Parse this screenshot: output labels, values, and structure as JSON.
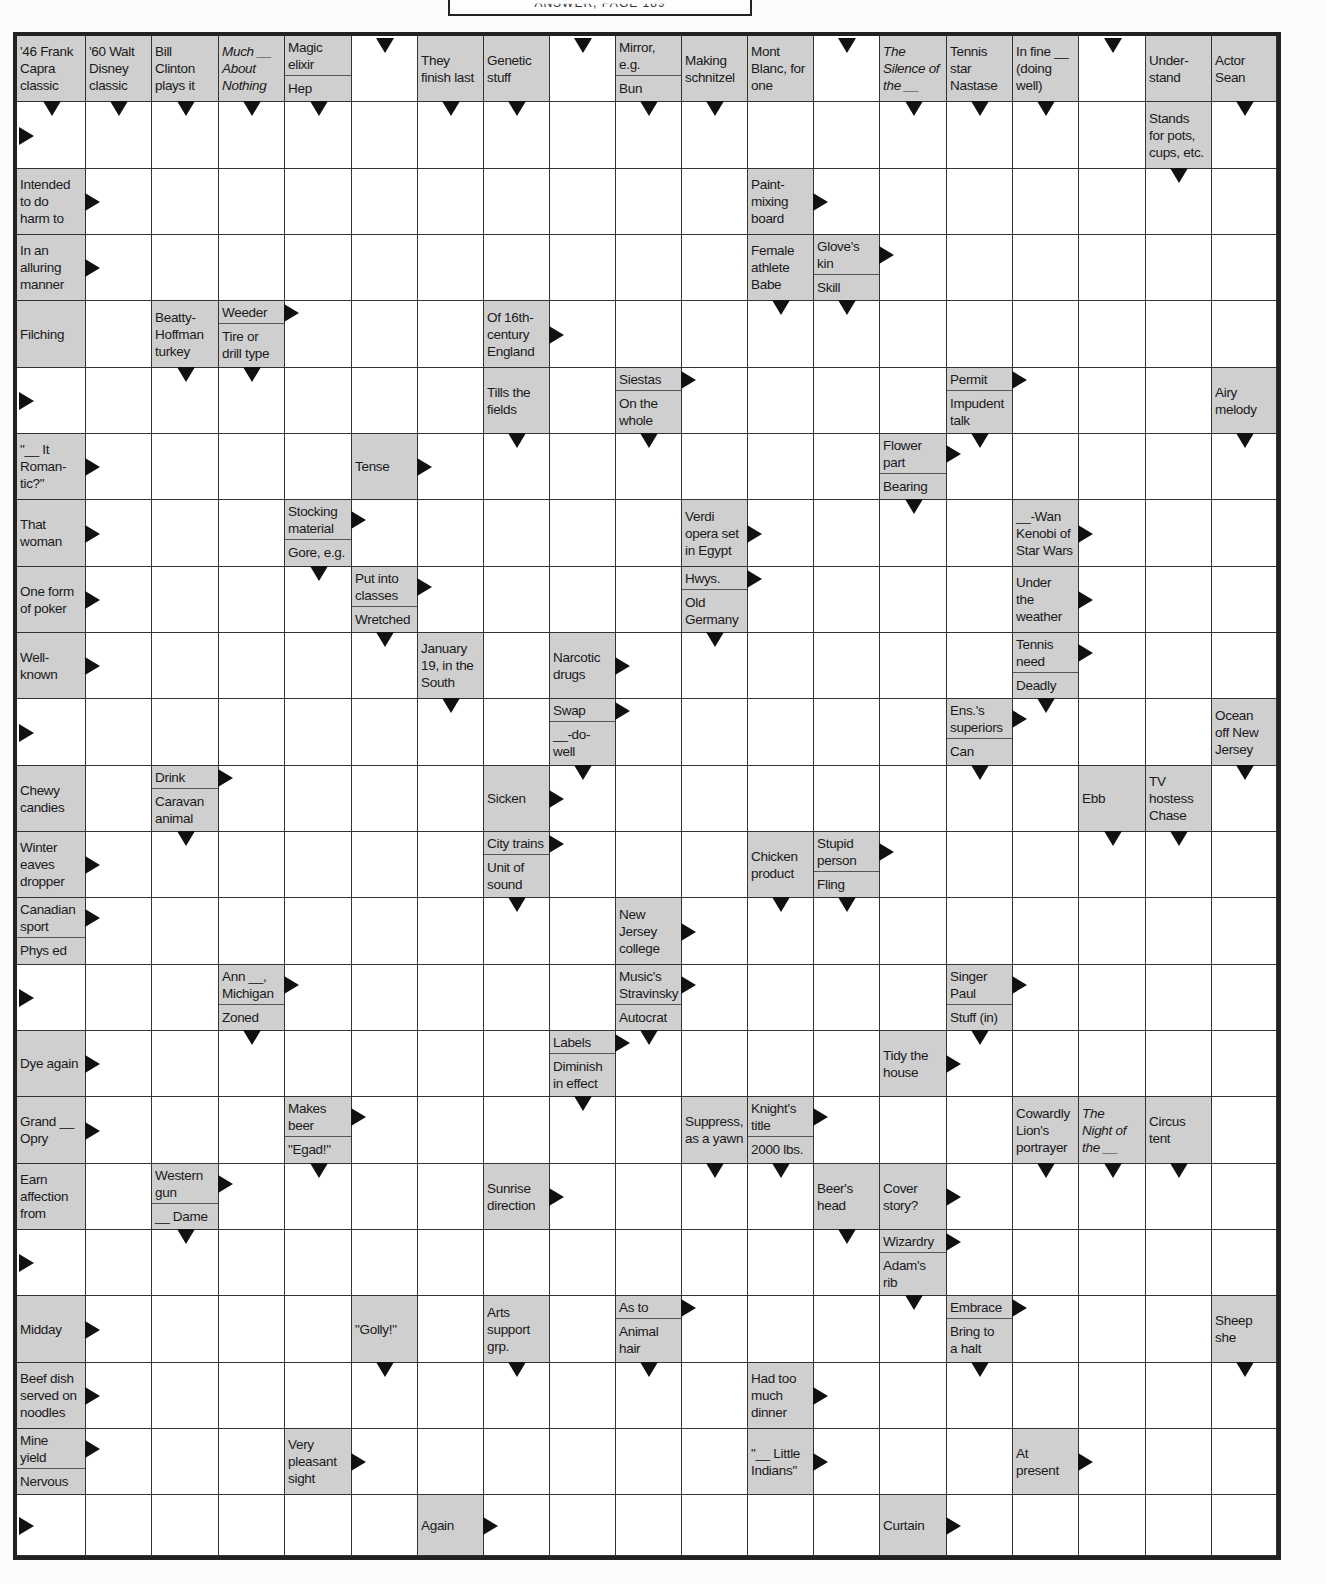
{
  "header": {
    "text": "ANSWER, PAGE 189"
  },
  "grid": {
    "cols": 19,
    "rows": 23,
    "col_x": [
      0,
      69,
      135,
      202,
      268,
      335,
      401,
      467,
      533,
      599,
      665,
      731,
      797,
      863,
      930,
      996,
      1062,
      1129,
      1195,
      1260
    ],
    "row_y": [
      0,
      66,
      133,
      199,
      265,
      332,
      398,
      464,
      531,
      597,
      663,
      730,
      796,
      862,
      929,
      995,
      1061,
      1128,
      1194,
      1260,
      1327,
      1393,
      1459,
      1520
    ]
  },
  "clues": [
    {
      "r": 0,
      "c": 0,
      "parts": [
        {
          "text": "'46 Frank\nCapra\nclassic",
          "dir": "down"
        }
      ]
    },
    {
      "r": 0,
      "c": 1,
      "parts": [
        {
          "text": "'60 Walt\nDisney\nclassic",
          "dir": "down"
        }
      ]
    },
    {
      "r": 0,
      "c": 2,
      "parts": [
        {
          "text": "Bill\nClinton\nplays it",
          "dir": "down"
        }
      ]
    },
    {
      "r": 0,
      "c": 3,
      "parts": [
        {
          "text": "Much __\nAbout\nNothing",
          "dir": "down",
          "italic": true
        }
      ]
    },
    {
      "r": 0,
      "c": 4,
      "parts": [
        {
          "text": "Magic\nelixir",
          "dir": "none"
        },
        {
          "text": "Hep",
          "dir": "down"
        }
      ]
    },
    {
      "r": 0,
      "c": 6,
      "parts": [
        {
          "text": "They\nfinish last",
          "dir": "down"
        }
      ]
    },
    {
      "r": 0,
      "c": 7,
      "parts": [
        {
          "text": "Genetic\nstuff",
          "dir": "down"
        }
      ]
    },
    {
      "r": 0,
      "c": 9,
      "parts": [
        {
          "text": "Mirror,\ne.g.",
          "dir": "none"
        },
        {
          "text": "Bun",
          "dir": "down"
        }
      ]
    },
    {
      "r": 0,
      "c": 10,
      "parts": [
        {
          "text": "Making\nschnitzel",
          "dir": "down"
        }
      ]
    },
    {
      "r": 0,
      "c": 11,
      "parts": [
        {
          "text": "Mont\nBlanc, for\none",
          "dir": "none"
        }
      ]
    },
    {
      "r": 0,
      "c": 13,
      "parts": [
        {
          "text": "The\nSilence of\nthe __",
          "dir": "down",
          "italic": true
        }
      ]
    },
    {
      "r": 0,
      "c": 14,
      "parts": [
        {
          "text": "Tennis\nstar\nNastase",
          "dir": "down"
        }
      ]
    },
    {
      "r": 0,
      "c": 15,
      "parts": [
        {
          "text": "In fine __\n(doing\nwell)",
          "dir": "down"
        }
      ]
    },
    {
      "r": 0,
      "c": 17,
      "parts": [
        {
          "text": "Under-\nstand",
          "dir": "none"
        }
      ]
    },
    {
      "r": 0,
      "c": 18,
      "parts": [
        {
          "text": "Actor\nSean",
          "dir": "down"
        }
      ]
    },
    {
      "r": 1,
      "c": 17,
      "parts": [
        {
          "text": "Stands\nfor pots,\ncups, etc.",
          "dir": "down"
        }
      ]
    },
    {
      "r": 2,
      "c": 0,
      "parts": [
        {
          "text": "Intended\nto do\nharm to",
          "dir": "right"
        }
      ]
    },
    {
      "r": 2,
      "c": 11,
      "parts": [
        {
          "text": "Paint-\nmixing\nboard",
          "dir": "right"
        }
      ]
    },
    {
      "r": 3,
      "c": 0,
      "parts": [
        {
          "text": "In an\nalluring\nmanner",
          "dir": "right"
        }
      ]
    },
    {
      "r": 3,
      "c": 11,
      "parts": [
        {
          "text": "Female\nathlete\nBabe",
          "dir": "down"
        }
      ]
    },
    {
      "r": 3,
      "c": 12,
      "parts": [
        {
          "text": "Glove's\nkin",
          "dir": "right"
        },
        {
          "text": "Skill",
          "dir": "down"
        }
      ]
    },
    {
      "r": 4,
      "c": 0,
      "parts": [
        {
          "text": "Filching",
          "dir": "none"
        }
      ]
    },
    {
      "r": 4,
      "c": 2,
      "parts": [
        {
          "text": "Beatty-\nHoffman\nturkey",
          "dir": "down"
        }
      ]
    },
    {
      "r": 4,
      "c": 3,
      "parts": [
        {
          "text": "Weeder",
          "dir": "right"
        },
        {
          "text": "Tire or\ndrill type",
          "dir": "down"
        }
      ]
    },
    {
      "r": 4,
      "c": 7,
      "parts": [
        {
          "text": "Of 16th-\ncentury\nEngland",
          "dir": "right"
        }
      ]
    },
    {
      "r": 5,
      "c": 7,
      "parts": [
        {
          "text": "Tills the\nfields",
          "dir": "down"
        }
      ]
    },
    {
      "r": 5,
      "c": 9,
      "parts": [
        {
          "text": "Siestas",
          "dir": "right"
        },
        {
          "text": "On the\nwhole",
          "dir": "down"
        }
      ]
    },
    {
      "r": 5,
      "c": 14,
      "parts": [
        {
          "text": "Permit",
          "dir": "right"
        },
        {
          "text": "Impudent\ntalk",
          "dir": "down"
        }
      ]
    },
    {
      "r": 5,
      "c": 18,
      "parts": [
        {
          "text": "Airy\nmelody",
          "dir": "down"
        }
      ]
    },
    {
      "r": 6,
      "c": 0,
      "parts": [
        {
          "text": "\"__ It\nRoman-\ntic?\"",
          "dir": "right"
        }
      ]
    },
    {
      "r": 6,
      "c": 5,
      "parts": [
        {
          "text": "Tense",
          "dir": "right"
        }
      ]
    },
    {
      "r": 6,
      "c": 13,
      "parts": [
        {
          "text": "Flower\npart",
          "dir": "right"
        },
        {
          "text": "Bearing",
          "dir": "down"
        }
      ]
    },
    {
      "r": 7,
      "c": 0,
      "parts": [
        {
          "text": "That\nwoman",
          "dir": "right"
        }
      ]
    },
    {
      "r": 7,
      "c": 4,
      "parts": [
        {
          "text": "Stocking\nmaterial",
          "dir": "right"
        },
        {
          "text": "Gore, e.g.",
          "dir": "down"
        }
      ]
    },
    {
      "r": 7,
      "c": 10,
      "parts": [
        {
          "text": "Verdi\nopera set\nin Egypt",
          "dir": "right"
        }
      ]
    },
    {
      "r": 7,
      "c": 15,
      "parts": [
        {
          "text": "__-Wan\nKenobi of\nStar Wars",
          "dir": "right"
        }
      ]
    },
    {
      "r": 8,
      "c": 0,
      "parts": [
        {
          "text": "One form\nof poker",
          "dir": "right"
        }
      ]
    },
    {
      "r": 8,
      "c": 5,
      "parts": [
        {
          "text": "Put into\nclasses",
          "dir": "right"
        },
        {
          "text": "Wretched",
          "dir": "down"
        }
      ]
    },
    {
      "r": 8,
      "c": 10,
      "parts": [
        {
          "text": "Hwys.",
          "dir": "right"
        },
        {
          "text": "Old\nGermany",
          "dir": "down"
        }
      ]
    },
    {
      "r": 8,
      "c": 15,
      "parts": [
        {
          "text": "Under\nthe\nweather",
          "dir": "right"
        }
      ]
    },
    {
      "r": 9,
      "c": 0,
      "parts": [
        {
          "text": "Well-\nknown",
          "dir": "right"
        }
      ]
    },
    {
      "r": 9,
      "c": 6,
      "parts": [
        {
          "text": "January\n19, in the\nSouth",
          "dir": "down"
        }
      ]
    },
    {
      "r": 9,
      "c": 8,
      "parts": [
        {
          "text": "Narcotic\ndrugs",
          "dir": "right"
        }
      ]
    },
    {
      "r": 9,
      "c": 15,
      "parts": [
        {
          "text": "Tennis\nneed",
          "dir": "right"
        },
        {
          "text": "Deadly",
          "dir": "down"
        }
      ]
    },
    {
      "r": 10,
      "c": 8,
      "parts": [
        {
          "text": "Swap",
          "dir": "right"
        },
        {
          "text": "__-do-\nwell",
          "dir": "down"
        }
      ]
    },
    {
      "r": 10,
      "c": 14,
      "parts": [
        {
          "text": "Ens.'s\nsuperiors",
          "dir": "right"
        },
        {
          "text": "Can",
          "dir": "down"
        }
      ]
    },
    {
      "r": 10,
      "c": 18,
      "parts": [
        {
          "text": "Ocean\noff New\nJersey",
          "dir": "down"
        }
      ]
    },
    {
      "r": 11,
      "c": 0,
      "parts": [
        {
          "text": "Chewy\ncandies",
          "dir": "none"
        }
      ]
    },
    {
      "r": 11,
      "c": 2,
      "parts": [
        {
          "text": "Drink",
          "dir": "right"
        },
        {
          "text": "Caravan\nanimal",
          "dir": "down"
        }
      ]
    },
    {
      "r": 11,
      "c": 7,
      "parts": [
        {
          "text": "Sicken",
          "dir": "right"
        }
      ]
    },
    {
      "r": 11,
      "c": 16,
      "parts": [
        {
          "text": "Ebb",
          "dir": "down"
        }
      ]
    },
    {
      "r": 11,
      "c": 17,
      "parts": [
        {
          "text": "TV\nhostess\nChase",
          "dir": "down"
        }
      ]
    },
    {
      "r": 12,
      "c": 0,
      "parts": [
        {
          "text": "Winter\neaves\ndropper",
          "dir": "right"
        }
      ]
    },
    {
      "r": 12,
      "c": 7,
      "parts": [
        {
          "text": "City trains",
          "dir": "right"
        },
        {
          "text": "Unit of\nsound",
          "dir": "down"
        }
      ]
    },
    {
      "r": 12,
      "c": 11,
      "parts": [
        {
          "text": "Chicken\nproduct",
          "dir": "down"
        }
      ]
    },
    {
      "r": 12,
      "c": 12,
      "parts": [
        {
          "text": "Stupid\nperson",
          "dir": "right"
        },
        {
          "text": "Fling",
          "dir": "down"
        }
      ]
    },
    {
      "r": 13,
      "c": 0,
      "parts": [
        {
          "text": "Canadian\nsport",
          "dir": "right"
        },
        {
          "text": "Phys ed",
          "dir": "none"
        }
      ]
    },
    {
      "r": 13,
      "c": 9,
      "parts": [
        {
          "text": "New\nJersey\ncollege",
          "dir": "right"
        }
      ]
    },
    {
      "r": 14,
      "c": 3,
      "parts": [
        {
          "text": "Ann __,\nMichigan",
          "dir": "right"
        },
        {
          "text": "Zoned",
          "dir": "down"
        }
      ]
    },
    {
      "r": 14,
      "c": 9,
      "parts": [
        {
          "text": "Music's\nStravinsky",
          "dir": "right"
        },
        {
          "text": "Autocrat",
          "dir": "down"
        }
      ]
    },
    {
      "r": 14,
      "c": 14,
      "parts": [
        {
          "text": "Singer\nPaul",
          "dir": "right"
        },
        {
          "text": "Stuff (in)",
          "dir": "down"
        }
      ]
    },
    {
      "r": 15,
      "c": 0,
      "parts": [
        {
          "text": "Dye again",
          "dir": "right"
        }
      ]
    },
    {
      "r": 15,
      "c": 8,
      "parts": [
        {
          "text": "Labels",
          "dir": "right"
        },
        {
          "text": "Diminish\nin effect",
          "dir": "down"
        }
      ]
    },
    {
      "r": 15,
      "c": 13,
      "parts": [
        {
          "text": "Tidy the\nhouse",
          "dir": "right"
        }
      ]
    },
    {
      "r": 16,
      "c": 0,
      "parts": [
        {
          "text": "Grand __\nOpry",
          "dir": "right"
        }
      ]
    },
    {
      "r": 16,
      "c": 4,
      "parts": [
        {
          "text": "Makes\nbeer",
          "dir": "right"
        },
        {
          "text": "\"Egad!\"",
          "dir": "down"
        }
      ]
    },
    {
      "r": 16,
      "c": 10,
      "parts": [
        {
          "text": "Suppress,\nas a yawn",
          "dir": "down"
        }
      ]
    },
    {
      "r": 16,
      "c": 11,
      "parts": [
        {
          "text": "Knight's\ntitle",
          "dir": "right"
        },
        {
          "text": "2000 lbs.",
          "dir": "down"
        }
      ]
    },
    {
      "r": 16,
      "c": 15,
      "parts": [
        {
          "text": "Cowardly\nLion's\nportrayer",
          "dir": "down"
        }
      ]
    },
    {
      "r": 16,
      "c": 16,
      "parts": [
        {
          "text": "The\nNight of\nthe __",
          "dir": "down",
          "italic": true
        }
      ]
    },
    {
      "r": 16,
      "c": 17,
      "parts": [
        {
          "text": "Circus\ntent",
          "dir": "down"
        }
      ]
    },
    {
      "r": 17,
      "c": 0,
      "parts": [
        {
          "text": "Earn\naffection\nfrom",
          "dir": "none"
        }
      ]
    },
    {
      "r": 17,
      "c": 2,
      "parts": [
        {
          "text": "Western\ngun",
          "dir": "right"
        },
        {
          "text": "__ Dame",
          "dir": "down"
        }
      ]
    },
    {
      "r": 17,
      "c": 7,
      "parts": [
        {
          "text": "Sunrise\ndirection",
          "dir": "right"
        }
      ]
    },
    {
      "r": 17,
      "c": 12,
      "parts": [
        {
          "text": "Beer's\nhead",
          "dir": "down"
        }
      ]
    },
    {
      "r": 17,
      "c": 13,
      "parts": [
        {
          "text": "Cover\nstory?",
          "dir": "right"
        }
      ]
    },
    {
      "r": 18,
      "c": 13,
      "parts": [
        {
          "text": "Wizardry",
          "dir": "right"
        },
        {
          "text": "Adam's\nrib",
          "dir": "down"
        }
      ]
    },
    {
      "r": 19,
      "c": 0,
      "parts": [
        {
          "text": "Midday",
          "dir": "right"
        }
      ]
    },
    {
      "r": 19,
      "c": 5,
      "parts": [
        {
          "text": "\"Golly!\"",
          "dir": "down"
        }
      ]
    },
    {
      "r": 19,
      "c": 7,
      "parts": [
        {
          "text": "Arts\nsupport\ngrp.",
          "dir": "down"
        }
      ]
    },
    {
      "r": 19,
      "c": 9,
      "parts": [
        {
          "text": "As to",
          "dir": "right"
        },
        {
          "text": "Animal\nhair",
          "dir": "down"
        }
      ]
    },
    {
      "r": 19,
      "c": 14,
      "parts": [
        {
          "text": "Embrace",
          "dir": "right"
        },
        {
          "text": "Bring to\na halt",
          "dir": "down"
        }
      ]
    },
    {
      "r": 19,
      "c": 18,
      "parts": [
        {
          "text": "Sheep\nshe",
          "dir": "down"
        }
      ]
    },
    {
      "r": 20,
      "c": 0,
      "parts": [
        {
          "text": "Beef dish\nserved on\nnoodles",
          "dir": "right"
        }
      ]
    },
    {
      "r": 20,
      "c": 11,
      "parts": [
        {
          "text": "Had too\nmuch\ndinner",
          "dir": "right"
        }
      ]
    },
    {
      "r": 21,
      "c": 0,
      "parts": [
        {
          "text": "Mine\nyield",
          "dir": "right"
        },
        {
          "text": "Nervous",
          "dir": "none"
        }
      ]
    },
    {
      "r": 21,
      "c": 4,
      "parts": [
        {
          "text": "Very\npleasant\nsight",
          "dir": "right"
        }
      ]
    },
    {
      "r": 21,
      "c": 11,
      "parts": [
        {
          "text": "\"__ Little\nIndians\"",
          "dir": "right"
        }
      ]
    },
    {
      "r": 21,
      "c": 15,
      "parts": [
        {
          "text": "At\npresent",
          "dir": "right"
        }
      ]
    },
    {
      "r": 22,
      "c": 6,
      "parts": [
        {
          "text": "Again",
          "dir": "right"
        }
      ]
    },
    {
      "r": 22,
      "c": 13,
      "parts": [
        {
          "text": "Curtain",
          "dir": "right"
        }
      ]
    }
  ],
  "edge_arrows": [
    {
      "r": 0,
      "c": 5,
      "dir": "down-top"
    },
    {
      "r": 0,
      "c": 8,
      "dir": "down-top"
    },
    {
      "r": 0,
      "c": 12,
      "dir": "down-top"
    },
    {
      "r": 0,
      "c": 16,
      "dir": "down-top"
    },
    {
      "r": 1,
      "c": 0,
      "dir": "right-left"
    },
    {
      "r": 5,
      "c": 0,
      "dir": "right-left"
    },
    {
      "r": 10,
      "c": 0,
      "dir": "right-left"
    },
    {
      "r": 14,
      "c": 0,
      "dir": "right-left"
    },
    {
      "r": 18,
      "c": 0,
      "dir": "right-left"
    },
    {
      "r": 22,
      "c": 0,
      "dir": "right-left"
    }
  ]
}
